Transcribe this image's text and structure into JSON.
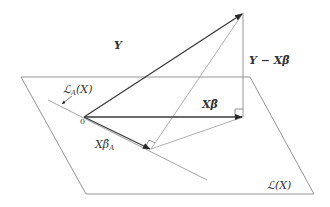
{
  "diagram": {
    "colors": {
      "background": "#ffffff",
      "plane": "#8a8a8a",
      "vector": "#3a3a3a",
      "thin": "#9a9a9a",
      "text": "#333333"
    },
    "plane": {
      "label": "ℒ(X)",
      "corners": [
        [
          21,
          77
        ],
        [
          250,
          77
        ],
        [
          314,
          194
        ],
        [
          86,
          194
        ]
      ]
    },
    "subspace_line": {
      "label_main": "ℒ",
      "label_sub": "A",
      "label_arg": "(X)",
      "from": [
        48,
        100
      ],
      "to": [
        207,
        180
      ]
    },
    "origin": {
      "label": "0",
      "point": [
        84,
        117
      ]
    },
    "vectors": [
      {
        "id": "Y",
        "label": "Y",
        "from": [
          84,
          117
        ],
        "to": [
          243,
          13
        ]
      },
      {
        "id": "Xbeta",
        "label": "Xβ̂",
        "from": [
          84,
          117
        ],
        "to": [
          243,
          117
        ]
      },
      {
        "id": "XbetaA",
        "label_main": "Xβ̂",
        "label_sub": "A",
        "from": [
          84,
          117
        ],
        "to": [
          151,
          149
        ]
      }
    ],
    "residual": {
      "label": "Y − Xβ̂",
      "from": [
        243,
        13
      ],
      "to": [
        243,
        117
      ]
    },
    "helper_lines": [
      {
        "from": [
          243,
          13
        ],
        "to": [
          151,
          149
        ]
      },
      {
        "from": [
          151,
          149
        ],
        "to": [
          243,
          117
        ]
      }
    ],
    "right_angles": [
      {
        "at": [
          243,
          117
        ],
        "label": "right-angle-residual"
      },
      {
        "at": [
          151,
          149
        ],
        "label": "right-angle-subspace"
      }
    ]
  }
}
